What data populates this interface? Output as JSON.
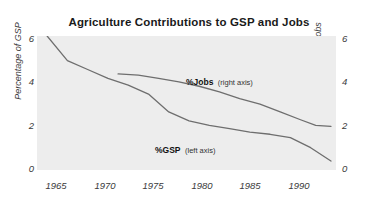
{
  "chart_data": {
    "type": "line",
    "title": "Agriculture Contributions to GSP and Jobs",
    "xlabel": "",
    "ylabel": "Percentage of GSP",
    "y2label": "Percentage of Jobs",
    "xlim": [
      1964,
      1993.5
    ],
    "ylim": [
      0,
      6
    ],
    "y2lim": [
      0,
      6
    ],
    "grid": false,
    "legend_position": "inline-annotations",
    "background": "#ededed",
    "line_color": "#6e6e6e",
    "xticks": [
      1965,
      1970,
      1975,
      1980,
      1985,
      1990
    ],
    "xticklabels": [
      "1965",
      "1970",
      "1975",
      "1980",
      "1985",
      "1990"
    ],
    "yticks": [
      0,
      2,
      4,
      6
    ],
    "yticklabels": [
      "0",
      "2",
      "4",
      "6"
    ],
    "y2ticks": [
      0,
      2,
      4,
      6
    ],
    "y2ticklabels": [
      "0",
      "2",
      "4",
      "6"
    ],
    "series": [
      {
        "name": "%GSP",
        "axis": "left",
        "annotation": "(left axis)",
        "x": [
          1965,
          1967,
          1969,
          1971,
          1973,
          1975,
          1977,
          1979,
          1981,
          1983,
          1985,
          1987,
          1989,
          1991,
          1993
        ],
        "values": [
          6.0,
          4.9,
          4.5,
          4.1,
          3.8,
          3.4,
          2.6,
          2.2,
          2.0,
          1.85,
          1.7,
          1.6,
          1.45,
          1.0,
          0.4
        ]
      },
      {
        "name": "%Jobs",
        "axis": "right",
        "annotation": "(right axis)",
        "x": [
          1972,
          1974,
          1976,
          1978,
          1980,
          1982,
          1984,
          1986,
          1988,
          1990,
          1991.5,
          1993
        ],
        "values": [
          4.3,
          4.25,
          4.1,
          3.95,
          3.75,
          3.5,
          3.2,
          2.95,
          2.6,
          2.25,
          2.0,
          1.95
        ]
      }
    ]
  },
  "axes": {
    "left_title": "Percentage of GSP",
    "right_title": "Percentage of Jobs"
  }
}
